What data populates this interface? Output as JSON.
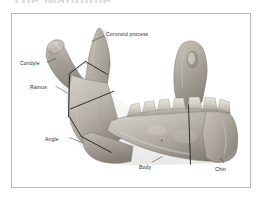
{
  "page": {
    "title": "The Mandible",
    "background_color": "#ffffff"
  },
  "figure": {
    "name": "mandible-photograph",
    "frame_color": "#b9b9b9",
    "caption": "",
    "specimen": "human mandible, right lateral view",
    "bone_color_light": "#d8d4cb",
    "bone_color_mid": "#a9a399",
    "bone_color_dark": "#6e675e",
    "region_line_color": "#1a1a1a",
    "labels": [
      {
        "id": "coronoid-process",
        "text": "Coronoid process"
      },
      {
        "id": "condyle",
        "text": "Condyle"
      },
      {
        "id": "ramus",
        "text": "Ramus"
      },
      {
        "id": "angle",
        "text": "Angle"
      },
      {
        "id": "body",
        "text": "Body"
      },
      {
        "id": "chin",
        "text": "Chin"
      }
    ]
  }
}
